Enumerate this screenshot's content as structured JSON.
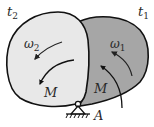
{
  "diagram": {
    "type": "rigid-body-rotation-about-pivot",
    "colors": {
      "body_t2_fill": "#e8e8e8",
      "body_t1_fill": "#a6a6a6",
      "outline": "#111111",
      "arrow": "#222222",
      "label": "#2a2a2a"
    },
    "labels": {
      "t2": {
        "base": "t",
        "sub": "2"
      },
      "t1": {
        "base": "t",
        "sub": "1"
      },
      "omega2": {
        "base": "ω",
        "sub": "2"
      },
      "omega1": {
        "base": "ω",
        "sub": "1"
      },
      "moment_left": "M",
      "moment_right": "M",
      "pivot": "A"
    },
    "elements": [
      {
        "id": "body-t1",
        "description": "body position at time t1 (dark grey)"
      },
      {
        "id": "body-t2",
        "description": "body position at time t2 (light grey)"
      },
      {
        "id": "pivot-A",
        "description": "pin support with ground hatching"
      }
    ]
  }
}
